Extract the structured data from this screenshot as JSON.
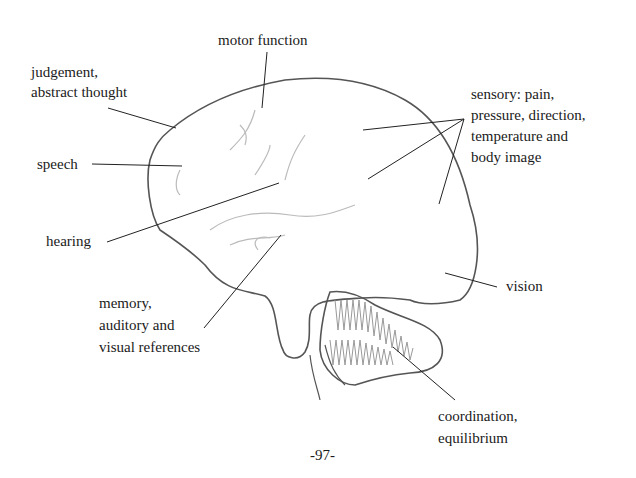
{
  "diagram": {
    "labels": {
      "motor": "motor function",
      "judgement": [
        "judgement,",
        "abstract thought"
      ],
      "speech": "speech",
      "hearing": "hearing",
      "memory": [
        "memory,",
        "auditory and",
        "visual references"
      ],
      "sensory": [
        "sensory: pain,",
        "pressure, direction,",
        "temperature and",
        "body image"
      ],
      "vision": "vision",
      "coordination": [
        "coordination,",
        "equilibrium"
      ]
    },
    "page_number": "-97-",
    "colors": {
      "outline": "#555555",
      "pointer": "#222222",
      "gyri": "#bbbbbb",
      "hatch": "#888888"
    }
  }
}
